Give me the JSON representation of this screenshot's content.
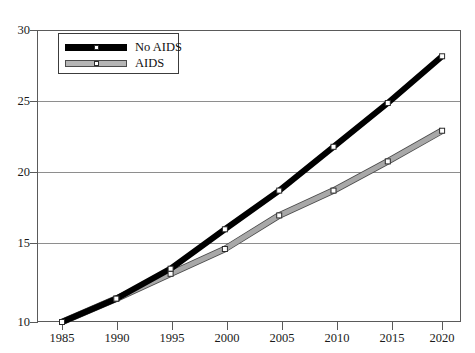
{
  "chart_data": {
    "type": "line",
    "title": "",
    "xlabel": "",
    "ylabel": "",
    "x": [
      1985,
      1990,
      1995,
      2000,
      2005,
      2010,
      2015,
      2020
    ],
    "xticklabels": [
      "1985",
      "1990",
      "1995",
      "2000",
      "2005",
      "2010",
      "2015",
      "2020"
    ],
    "yticks": [
      10,
      15,
      20,
      25,
      30
    ],
    "yticklabels": [
      "10",
      "15",
      "20",
      "25",
      "30"
    ],
    "xlim": [
      1983.5,
      2021.5
    ],
    "ylim": [
      10,
      30
    ],
    "grid": "horizontal",
    "legend_position": "upper left",
    "series": [
      {
        "name": "No AIDS",
        "color": "#000000",
        "marker": "white-square",
        "values": [
          10.0,
          11.6,
          13.65,
          16.35,
          19.0,
          22.0,
          25.0,
          28.2
        ]
      },
      {
        "name": "AIDS",
        "color": "#a8a8a8",
        "marker": "white-square",
        "values": [
          10.0,
          11.6,
          13.3,
          15.0,
          17.3,
          19.0,
          21.0,
          23.1
        ]
      }
    ]
  },
  "legend": {
    "items": [
      {
        "label": "No AIDS"
      },
      {
        "label": "AIDS"
      }
    ]
  },
  "axes": {
    "y_labels": [
      "30",
      "25",
      "20",
      "15",
      "10"
    ],
    "x_labels": [
      "1985",
      "1990",
      "1995",
      "2000",
      "2005",
      "2010",
      "2015",
      "2020"
    ]
  }
}
